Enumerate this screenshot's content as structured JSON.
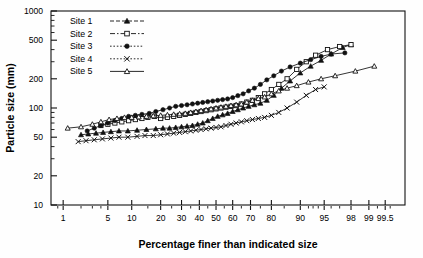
{
  "chart_data": {
    "type": "line",
    "title": "",
    "subtitle": "",
    "xlabel": "Percentage finer than indicated size",
    "ylabel": "Particle size (mm)",
    "yscale": "log",
    "xscale": "probability",
    "ylim": [
      10,
      1000
    ],
    "xlim": [
      0.6,
      99.8
    ],
    "grid": false,
    "legend_position": "top-left",
    "ytick_labels": [
      "1000",
      "500",
      "200",
      "100",
      "50",
      "20",
      "10"
    ],
    "ytick_values": [
      1000,
      500,
      200,
      100,
      50,
      20,
      10
    ],
    "xtick_labels": [
      "1",
      "5",
      "10",
      "20",
      "30",
      "40",
      "50",
      "60",
      "70",
      "80",
      "90",
      "95",
      "98",
      "99",
      "99.5"
    ],
    "xtick_values": [
      1,
      5,
      10,
      20,
      30,
      40,
      50,
      60,
      70,
      80,
      90,
      95,
      98,
      99,
      99.5
    ],
    "legend": [
      {
        "label": "Site 1",
        "marker": "filled-triangle",
        "line": "dashed"
      },
      {
        "label": "Site 2",
        "marker": "open-square",
        "line": "dash-dot"
      },
      {
        "label": "Site 3",
        "marker": "filled-circle",
        "line": "dotted"
      },
      {
        "label": "Site 4",
        "marker": "cross-x",
        "line": "dotted"
      },
      {
        "label": "Site 5",
        "marker": "open-triangle",
        "line": "solid"
      }
    ],
    "series": [
      {
        "name": "Site 1",
        "marker": "filled-triangle",
        "x": [
          2.0,
          2.6,
          3.4,
          4.3,
          5.5,
          7.0,
          9.0,
          11.5,
          14.5,
          18.0,
          21.0,
          24.0,
          27.0,
          30.0,
          33.0,
          36.0,
          39.0,
          42.0,
          45.0,
          48.0,
          51.0,
          54.0,
          57.0,
          60.0,
          63.0,
          66.0,
          69.0,
          72.0,
          75.0,
          78.0,
          81.0,
          84.0,
          87.0,
          90.0,
          92.5,
          94.5,
          96.0,
          97.3,
          98.0
        ],
        "y": [
          53,
          54,
          55,
          56,
          57,
          58,
          58,
          59,
          60,
          61,
          62,
          62,
          63,
          64,
          65,
          66,
          68,
          70,
          74,
          78,
          82,
          85,
          88,
          92,
          96,
          100,
          104,
          108,
          112,
          120,
          135,
          160,
          190,
          230,
          270,
          310,
          360,
          420,
          450
        ]
      },
      {
        "name": "Site 2",
        "marker": "open-square",
        "x": [
          4.0,
          5.0,
          6.2,
          7.6,
          9.2,
          11.0,
          13.0,
          15.0,
          17.5,
          20.0,
          23.0,
          26.0,
          29.0,
          32.0,
          35.0,
          38.0,
          41.0,
          44.0,
          47.0,
          50.0,
          53.0,
          56.0,
          59.0,
          62.0,
          65.0,
          68.0,
          71.0,
          74.0,
          77.0,
          80.0,
          83.0,
          86.0,
          89.0,
          91.5,
          93.5,
          95.5,
          97.0,
          98.0
        ],
        "y": [
          66,
          68,
          70,
          72,
          74,
          76,
          78,
          80,
          82,
          78,
          80,
          82,
          84,
          86,
          88,
          90,
          92,
          94,
          96,
          98,
          100,
          102,
          104,
          106,
          110,
          115,
          120,
          128,
          140,
          155,
          175,
          200,
          250,
          300,
          350,
          400,
          430,
          450
        ]
      },
      {
        "name": "Site 3",
        "marker": "filled-circle",
        "x": [
          2.5,
          3.2,
          4.0,
          5.0,
          6.2,
          7.6,
          9.2,
          11.0,
          13.0,
          15.5,
          18.0,
          21.0,
          24.0,
          27.0,
          30.0,
          33.0,
          36.0,
          39.0,
          42.0,
          45.0,
          48.0,
          51.0,
          54.0,
          57.0,
          60.0,
          63.0,
          66.0,
          69.0,
          72.0,
          75.0,
          78.0,
          81.0,
          84.0,
          87.0,
          90.0,
          92.5,
          94.5,
          96.0,
          97.5
        ],
        "y": [
          58,
          62,
          66,
          70,
          74,
          78,
          82,
          84,
          86,
          88,
          92,
          96,
          100,
          104,
          106,
          108,
          110,
          112,
          114,
          116,
          118,
          120,
          122,
          124,
          128,
          134,
          140,
          150,
          160,
          175,
          195,
          215,
          240,
          265,
          290,
          315,
          340,
          360,
          370
        ]
      },
      {
        "name": "Site 4",
        "marker": "cross-x",
        "x": [
          1.8,
          2.4,
          3.2,
          4.2,
          5.5,
          7.0,
          9.0,
          11.5,
          14.0,
          17.0,
          20.0,
          23.0,
          26.0,
          29.0,
          32.0,
          35.0,
          38.0,
          41.0,
          44.0,
          47.0,
          50.0,
          53.0,
          56.0,
          59.0,
          62.0,
          65.0,
          68.0,
          71.0,
          74.0,
          77.0,
          80.0,
          83.0,
          86.0,
          89.0,
          91.5,
          93.5,
          95.0
        ],
        "y": [
          45,
          46,
          47,
          48,
          49,
          50,
          50,
          51,
          52,
          52,
          53,
          54,
          55,
          56,
          57,
          58,
          59,
          60,
          61,
          62,
          63,
          64,
          66,
          68,
          70,
          72,
          74,
          76,
          78,
          80,
          84,
          90,
          100,
          115,
          135,
          155,
          165
        ]
      },
      {
        "name": "Site 5",
        "marker": "open-triangle",
        "x": [
          1.2,
          2.0,
          3.0,
          4.0,
          5.2,
          6.6,
          8.2,
          10.0,
          12.0,
          14.5,
          17.0,
          20.0,
          23.0,
          26.0,
          29.0,
          32.0,
          35.0,
          38.0,
          41.0,
          44.0,
          47.0,
          50.0,
          53.0,
          56.0,
          59.0,
          62.0,
          65.0,
          68.0,
          71.0,
          74.0,
          77.0,
          80.0,
          83.0,
          86.0,
          89.0,
          92.0,
          94.5,
          96.5,
          98.3,
          99.2
        ],
        "y": [
          62,
          64,
          68,
          72,
          76,
          78,
          80,
          80,
          81,
          82,
          83,
          84,
          85,
          86,
          87,
          88,
          90,
          92,
          94,
          96,
          98,
          100,
          102,
          104,
          106,
          108,
          110,
          115,
          120,
          125,
          130,
          140,
          150,
          160,
          170,
          185,
          200,
          215,
          240,
          270
        ]
      }
    ]
  }
}
